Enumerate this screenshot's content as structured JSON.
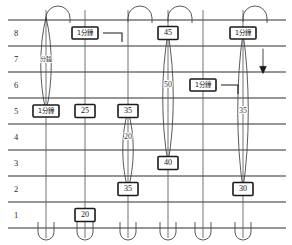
{
  "chart_data": {
    "type": "diagram",
    "title": "",
    "xlabel": "",
    "ylabel": "",
    "grid": true,
    "row_labels": [
      "8",
      "7",
      "6",
      "5",
      "4",
      "3",
      "2",
      "1"
    ],
    "row_values": [
      8,
      7,
      6,
      5,
      4,
      3,
      2,
      1
    ],
    "ylim": [
      1,
      8
    ],
    "legend_position": "none",
    "columns": [
      {
        "id": "col-1",
        "x": 46,
        "markers": [
          {
            "label": "分鐘",
            "boxed": false,
            "row": 7
          },
          {
            "label": "1分鐘",
            "boxed": true,
            "row": 5
          }
        ],
        "loops": [
          {
            "top_row": 8.6,
            "bottom_row": 5
          }
        ],
        "top_arch": true,
        "bottom_arch": true
      },
      {
        "id": "col-2",
        "x": 85,
        "markers": [
          {
            "label": "1分鐘",
            "boxed": true,
            "row": 8
          },
          {
            "label": "25",
            "boxed": true,
            "row": 5
          },
          {
            "label": "20",
            "boxed": true,
            "row": 1
          }
        ],
        "loops": [],
        "top_arch": false,
        "bottom_arch": true
      },
      {
        "id": "col-3",
        "x": 128,
        "markers": [
          {
            "label": "35",
            "boxed": true,
            "row": 5
          },
          {
            "label": "20",
            "boxed": false,
            "row": 4
          },
          {
            "label": "35",
            "boxed": true,
            "row": 2
          }
        ],
        "loops": [
          {
            "top_row": 5,
            "bottom_row": 2
          }
        ],
        "top_arch": true,
        "bottom_arch": true
      },
      {
        "id": "col-4",
        "x": 168,
        "markers": [
          {
            "label": "45",
            "boxed": true,
            "row": 8
          },
          {
            "label": "50",
            "boxed": false,
            "row": 6
          },
          {
            "label": "40",
            "boxed": true,
            "row": 3
          }
        ],
        "loops": [
          {
            "top_row": 8,
            "bottom_row": 3
          }
        ],
        "top_arch": true,
        "bottom_arch": true
      },
      {
        "id": "col-5",
        "x": 203,
        "markers": [
          {
            "label": "1分鐘",
            "boxed": true,
            "row": 6
          }
        ],
        "loops": [],
        "top_arch": false,
        "bottom_arch": true
      },
      {
        "id": "col-6",
        "x": 243,
        "markers": [
          {
            "label": "1分鐘",
            "boxed": true,
            "row": 8
          },
          {
            "label": "35",
            "boxed": false,
            "row": 5
          },
          {
            "label": "30",
            "boxed": true,
            "row": 2
          }
        ],
        "loops": [
          {
            "top_row": 8,
            "bottom_row": 2
          }
        ],
        "top_arch": true,
        "bottom_arch": true
      }
    ],
    "annotations": [
      {
        "id": "arrow-down",
        "type": "arrow",
        "direction": "down",
        "x": 263,
        "from_row": 7.4,
        "to_row": 6.6
      }
    ],
    "leader_lines": [
      {
        "id": "leader-col2-row8",
        "from_x": 103,
        "from_row": 8,
        "to_x": 122,
        "to_row": 8
      },
      {
        "id": "leader-col5-row6",
        "from_x": 221,
        "from_row": 6,
        "to_x": 238,
        "to_row": 6
      }
    ]
  }
}
